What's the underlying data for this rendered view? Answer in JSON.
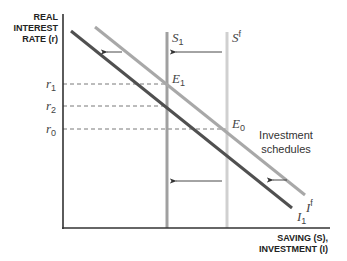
{
  "diagram": {
    "y_axis_label": [
      "REAL",
      "INTEREST",
      "RATE (r)"
    ],
    "x_axis_label": [
      "SAVING (S),",
      "INVESTMENT (I)"
    ],
    "interest_rates": [
      {
        "symbol": "r",
        "sub": "1",
        "y": 84
      },
      {
        "symbol": "r",
        "sub": "2",
        "y": 106
      },
      {
        "symbol": "r",
        "sub": "0",
        "y": 129
      }
    ],
    "saving_curves": [
      {
        "symbol": "S",
        "sub": "1",
        "color": "#a0a0a0"
      },
      {
        "symbol": "S",
        "sup": "f",
        "color": "#d0d0d0"
      }
    ],
    "investment_curves": [
      {
        "symbol": "I",
        "sub": "1",
        "color": "#505050"
      },
      {
        "symbol": "I",
        "sup": "f",
        "color": "#a8a8a8"
      }
    ],
    "equilibria": [
      {
        "symbol": "E",
        "sub": "1"
      },
      {
        "symbol": "E",
        "sub": "0"
      }
    ],
    "annotation": [
      "Investment",
      "schedules"
    ],
    "colors": {
      "axis": "#333333",
      "dark_line": "#505050",
      "light_line": "#a8a8a8",
      "s1_line": "#a0a0a0",
      "sf_line": "#d0d0d0",
      "dash": "#555555",
      "arrow": "#333333"
    }
  }
}
